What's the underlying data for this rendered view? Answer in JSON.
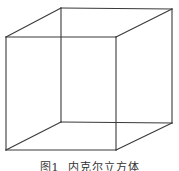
{
  "figure": {
    "label": "图1",
    "title": "内克尔立方体",
    "line_color": "#3a3a3a",
    "edges": [
      "front-top",
      "front-bottom",
      "front-left",
      "front-right",
      "back-top",
      "back-bottom",
      "back-left",
      "back-right",
      "connector-top-left",
      "connector-top-right",
      "connector-bottom-left",
      "connector-bottom-right"
    ]
  }
}
